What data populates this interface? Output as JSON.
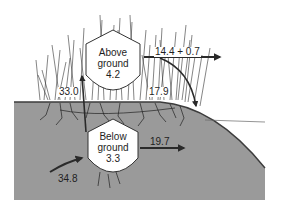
{
  "diagram": {
    "type": "carbon/biomass flow diagram",
    "colors": {
      "soil": "#9a9a9a",
      "soil_edge": "#3c3c3c",
      "grass": "#333333",
      "arrow": "#2a2a2a",
      "pool_fill": "#ffffff"
    },
    "pools": [
      {
        "id": "above",
        "label_line1": "Above",
        "label_line2": "ground",
        "value": "4.2"
      },
      {
        "id": "below",
        "label_line1": "Below",
        "label_line2": "ground",
        "value": "3.3"
      }
    ],
    "flows": [
      {
        "id": "input-below",
        "value": "34.8",
        "from": "outside",
        "to": "below"
      },
      {
        "id": "below-to-above",
        "value": "33.0",
        "from": "below",
        "to": "above"
      },
      {
        "id": "above-export",
        "value": "14.4 + 0.7",
        "from": "above",
        "to": "outside"
      },
      {
        "id": "above-to-litter",
        "value": "17.9",
        "from": "above",
        "to": "ground"
      },
      {
        "id": "below-export",
        "value": "19.7",
        "from": "below",
        "to": "outside"
      }
    ]
  }
}
